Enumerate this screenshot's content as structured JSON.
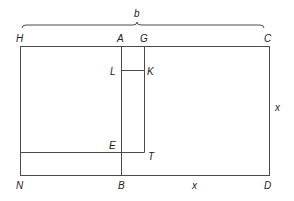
{
  "diagram": {
    "brace_label": "b",
    "points": {
      "H": "H",
      "A": "A",
      "G": "G",
      "C": "C",
      "L": "L",
      "K": "K",
      "E": "E",
      "T": "T",
      "N": "N",
      "B": "B",
      "D": "D"
    },
    "side_labels": {
      "bottom_BD": "x",
      "right_CD": "x"
    },
    "line_color": "#4a4a4a",
    "text_color": "#222222"
  }
}
